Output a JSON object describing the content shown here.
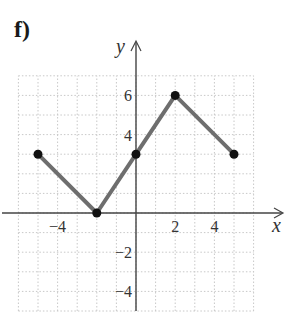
{
  "part_label": "f)",
  "chart_data": {
    "type": "line",
    "title": "",
    "xlabel": "x",
    "ylabel": "y",
    "xlim": [
      -6,
      6
    ],
    "ylim": [
      -5,
      7
    ],
    "grid": true,
    "x_ticks": [
      -4,
      2,
      4
    ],
    "x_tick_labels": [
      "−4",
      "2",
      "4"
    ],
    "y_ticks": [
      6,
      4,
      -2,
      -4
    ],
    "y_tick_labels": [
      "6",
      "4",
      "−2",
      "−4"
    ],
    "series": [
      {
        "name": "piecewise",
        "points": [
          [
            -5,
            3
          ],
          [
            -2,
            0
          ],
          [
            0,
            3
          ],
          [
            2,
            6
          ],
          [
            5,
            3
          ]
        ],
        "color": "#6e6e6e",
        "marker_color": "#111111"
      }
    ]
  }
}
